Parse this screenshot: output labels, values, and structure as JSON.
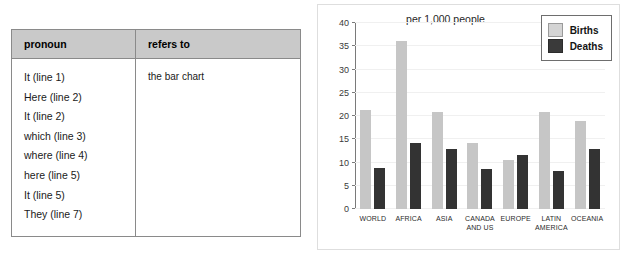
{
  "table": {
    "headers": [
      "pronoun",
      "refers to"
    ],
    "pronouns": [
      "It (line 1)",
      "Here (line 2)",
      "It (line 2)",
      "which (line 3)",
      "where (line 4)",
      "here (line 5)",
      "It (line 5)",
      "They (line 7)"
    ],
    "answer": "the bar chart"
  },
  "chart_data": {
    "type": "bar",
    "title": "per 1,000 people",
    "xlabel": "",
    "ylabel": "",
    "ylim": [
      0,
      40
    ],
    "yticks": [
      0,
      5,
      10,
      15,
      20,
      25,
      30,
      35,
      40
    ],
    "grid": true,
    "legend_position": "top-right",
    "categories": [
      "WORLD",
      "AFRICA",
      "ASIA",
      "CANADA\nAND US",
      "EUROPE",
      "LATIN\nAMERICA",
      "OCEANIA"
    ],
    "series": [
      {
        "name": "Births",
        "color": "#c6c6c6",
        "values": [
          21.3,
          36.2,
          20.8,
          14.2,
          10.6,
          20.8,
          19.0
        ]
      },
      {
        "name": "Deaths",
        "color": "#333333",
        "values": [
          8.8,
          14.1,
          12.9,
          8.5,
          11.6,
          8.2,
          13.0
        ]
      }
    ]
  }
}
